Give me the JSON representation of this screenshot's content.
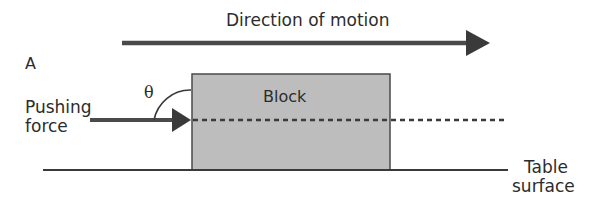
{
  "diagram": {
    "direction_label": "Direction of motion",
    "panel_label": "A",
    "force_label_line1": "Pushing",
    "force_label_line2": "force",
    "angle_symbol": "θ",
    "block_label": "Block",
    "surface_label_line1": "Table",
    "surface_label_line2": "surface",
    "colors": {
      "ink": "#3a3a3a",
      "block_fill": "#bdbdbd",
      "background": "#ffffff"
    }
  }
}
